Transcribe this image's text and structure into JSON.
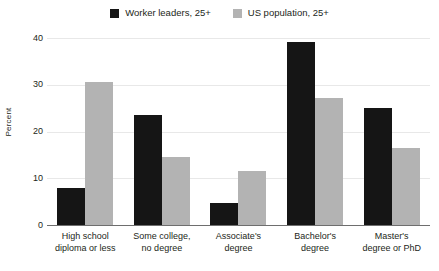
{
  "chart_data": {
    "type": "bar",
    "title": "",
    "xlabel": "",
    "ylabel": "Percent",
    "ylim": [
      0,
      40
    ],
    "yticks": [
      0,
      10,
      20,
      30,
      40
    ],
    "grid": true,
    "legend_position": "top-center",
    "categories": [
      "High school diploma or less",
      "Some college, no degree",
      "Associate's degree",
      "Bachelor's degree",
      "Master's degree or PhD"
    ],
    "category_lines": [
      [
        "High school",
        "diploma or less"
      ],
      [
        "Some college,",
        "no degree"
      ],
      [
        "Associate's",
        "degree"
      ],
      [
        "Bachelor's",
        "degree"
      ],
      [
        "Master's",
        "degree or PhD"
      ]
    ],
    "series": [
      {
        "name": "Worker leaders, 25+",
        "color": "#151515",
        "values": [
          7.9,
          23.5,
          4.7,
          39.1,
          25.0
        ]
      },
      {
        "name": "US population, 25+",
        "color": "#b3b3b3",
        "values": [
          30.6,
          14.5,
          11.5,
          27.2,
          16.5
        ]
      }
    ]
  },
  "ytick_labels": {
    "t0": "0",
    "t1": "10",
    "t2": "20",
    "t3": "30",
    "t4": "40"
  },
  "legend": {
    "entries": [
      {
        "label": "Worker leaders, 25+",
        "color": "#151515"
      },
      {
        "label": "US population, 25+",
        "color": "#b3b3b3"
      }
    ]
  },
  "axis": {
    "y_title": "Percent"
  },
  "xlabels": {
    "c0_l0": "High school",
    "c0_l1": "diploma or less",
    "c1_l0": "Some college,",
    "c1_l1": "no degree",
    "c2_l0": "Associate's",
    "c2_l1": "degree",
    "c3_l0": "Bachelor's",
    "c3_l1": "degree",
    "c4_l0": "Master's",
    "c4_l1": "degree or PhD"
  }
}
